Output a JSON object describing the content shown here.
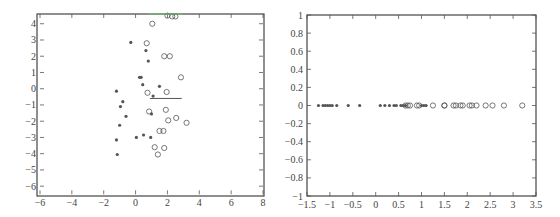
{
  "chart_data": [
    {
      "type": "scatter",
      "title": "",
      "xlabel": "",
      "ylabel": "",
      "xlim": [
        -6,
        8
      ],
      "ylim": [
        -6.5,
        4.6
      ],
      "grid": false,
      "x_ticks": [
        -6,
        -4,
        -2,
        0,
        2,
        4,
        6,
        8
      ],
      "y_ticks": [
        4,
        3,
        2,
        1,
        0,
        -1,
        -2,
        -3,
        -4,
        -5,
        -6
      ],
      "series": [
        {
          "name": "class 1 (stars)",
          "marker": "*",
          "points": [
            [
              -0.3,
              2.85
            ],
            [
              0.65,
              2.35
            ],
            [
              0.8,
              1.7
            ],
            [
              0.25,
              0.7
            ],
            [
              0.35,
              0.7
            ],
            [
              0.45,
              0.25
            ],
            [
              1.5,
              0.15
            ],
            [
              -1.2,
              -0.15
            ],
            [
              1.1,
              -0.45
            ],
            [
              -0.8,
              -0.8
            ],
            [
              -0.95,
              -1.1
            ],
            [
              -0.6,
              -1.7
            ],
            [
              1.0,
              -1.55
            ],
            [
              -1.0,
              -2.25
            ],
            [
              -1.2,
              -3.15
            ],
            [
              0.05,
              -3.0
            ],
            [
              0.5,
              -2.85
            ],
            [
              0.95,
              -3.0
            ],
            [
              -1.15,
              -4.05
            ]
          ]
        },
        {
          "name": "class 2 (circles)",
          "marker": "o",
          "points": [
            [
              1.05,
              4.0
            ],
            [
              2.0,
              4.5
            ],
            [
              2.3,
              4.45
            ],
            [
              2.5,
              4.45
            ],
            [
              0.7,
              2.8
            ],
            [
              1.8,
              2.0
            ],
            [
              2.15,
              2.0
            ],
            [
              2.85,
              0.7
            ],
            [
              0.75,
              -0.25
            ],
            [
              1.95,
              -0.2
            ],
            [
              0.85,
              -1.4
            ],
            [
              1.9,
              -1.3
            ],
            [
              2.05,
              -1.95
            ],
            [
              2.55,
              -1.8
            ],
            [
              3.2,
              -2.1
            ],
            [
              1.5,
              -2.6
            ],
            [
              1.75,
              -2.6
            ],
            [
              1.2,
              -3.6
            ],
            [
              1.8,
              -3.65
            ],
            [
              1.4,
              -4.05
            ]
          ]
        },
        {
          "name": "projection direction",
          "type": "line",
          "points": [
            [
              0.9,
              -0.6
            ],
            [
              2.9,
              -0.6
            ]
          ]
        },
        {
          "name": "top line (green)",
          "type": "line",
          "color": "#6cbf6c",
          "points": [
            [
              0.8,
              4.6
            ],
            [
              3.0,
              4.6
            ]
          ]
        }
      ]
    },
    {
      "type": "scatter",
      "title": "",
      "xlabel": "",
      "ylabel": "",
      "xlim": [
        -1.5,
        3.5
      ],
      "ylim": [
        -1,
        1
      ],
      "grid": false,
      "x_ticks": [
        -1.5,
        -1,
        -0.5,
        0,
        0.5,
        1,
        1.5,
        2,
        2.5,
        3,
        3.5
      ],
      "y_ticks": [
        1,
        0.8,
        0.6,
        0.4,
        0.2,
        0,
        -0.2,
        -0.4,
        -0.6,
        -0.8,
        -1
      ],
      "series": [
        {
          "name": "class 1 projected (stars)",
          "marker": "*",
          "x": [
            -1.25,
            -1.15,
            -1.1,
            -1.05,
            -1.0,
            -0.95,
            -0.85,
            -0.6,
            -0.35,
            0.1,
            0.2,
            0.3,
            0.4,
            0.45,
            0.55,
            0.6,
            0.65,
            1.0,
            1.05,
            1.1
          ],
          "y": 0
        },
        {
          "name": "class 2 projected (circles)",
          "marker": "o",
          "x": [
            0.65,
            0.7,
            0.75,
            0.9,
            0.95,
            1.25,
            1.5,
            1.5,
            1.7,
            1.75,
            1.85,
            1.9,
            2.05,
            2.1,
            2.2,
            2.4,
            2.55,
            2.8,
            3.2
          ],
          "y": 0
        }
      ]
    }
  ],
  "left_plot": {
    "x_tick_labels": [
      "−6",
      "−4",
      "−2",
      "0",
      "2",
      "4",
      "6",
      "8"
    ],
    "y_tick_labels": [
      "4",
      "3",
      "2",
      "1",
      "0",
      "−1",
      "−2",
      "−3",
      "−4",
      "−5",
      "−6"
    ]
  },
  "right_plot": {
    "x_tick_labels": [
      "−1.5",
      "−1",
      "−0.5",
      "0",
      "0.5",
      "1",
      "1.5",
      "2",
      "2.5",
      "3",
      "3.5"
    ],
    "y_tick_labels": [
      "1",
      "0.8",
      "0.6",
      "0.4",
      "0.2",
      "0",
      "−0.2",
      "−0.4",
      "−0.6",
      "−0.8",
      "−1"
    ]
  },
  "colors": {
    "marker": "#555555",
    "frame": "#444444",
    "green_line": "#6cbf6c"
  }
}
